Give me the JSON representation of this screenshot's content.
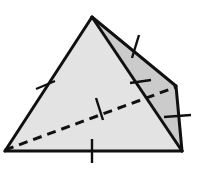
{
  "figure": {
    "name": "tetrahedron-diagram",
    "canvas": {
      "width": 203,
      "height": 175,
      "background": "#ffffff"
    },
    "colors": {
      "front_face_fill": "#e3e3e3",
      "right_face_fill": "#cbcbcb",
      "edge_stroke": "#101010",
      "hidden_edge_stroke": "#101010",
      "tick_stroke": "#101010"
    },
    "strokes": {
      "edge_width": 3.0,
      "hidden_edge_width": 3.0,
      "hidden_edge_dash": "9 6",
      "tick_width": 2.4
    },
    "vertices": [
      {
        "id": "apex",
        "label": "apex",
        "x": 92,
        "y": 17
      },
      {
        "id": "bottom-left",
        "label": "bottom left vertex",
        "x": 5,
        "y": 151
      },
      {
        "id": "bottom-right",
        "label": "bottom right vertex",
        "x": 182,
        "y": 151
      },
      {
        "id": "right-back",
        "label": "right back vertex",
        "x": 176,
        "y": 86
      }
    ],
    "faces": [
      {
        "id": "front-face",
        "label": "front triangular face",
        "points": "92,17 5,151 182,151",
        "fill": "#e3e3e3"
      },
      {
        "id": "right-face",
        "label": "right triangular face",
        "points": "92,17 176,86 182,151",
        "fill": "#cbcbcb"
      }
    ],
    "edges": [
      {
        "id": "edge-apex-bottom-left",
        "label": "apex to bottom left",
        "x1": 92,
        "y1": 17,
        "x2": 5,
        "y2": 151,
        "style": "solid"
      },
      {
        "id": "edge-bottom",
        "label": "bottom edge",
        "x1": 5,
        "y1": 151,
        "x2": 182,
        "y2": 151,
        "style": "solid"
      },
      {
        "id": "edge-apex-bottom-right",
        "label": "apex to bottom right",
        "x1": 92,
        "y1": 17,
        "x2": 182,
        "y2": 151,
        "style": "solid"
      },
      {
        "id": "edge-apex-right-back",
        "label": "apex to right back",
        "x1": 92,
        "y1": 17,
        "x2": 176,
        "y2": 86,
        "style": "solid"
      },
      {
        "id": "edge-right-back-bottom",
        "label": "right back to bottom right",
        "x1": 176,
        "y1": 86,
        "x2": 182,
        "y2": 151,
        "style": "solid"
      },
      {
        "id": "edge-hidden-diagonal",
        "label": "hidden edge bottom left to right back",
        "x1": 5,
        "y1": 150,
        "x2": 176,
        "y2": 87,
        "style": "dashed"
      }
    ],
    "tick_marks": [
      {
        "id": "tick-left-edge",
        "label": "tick on apex to bottom left edge",
        "x1": 36,
        "y1": 89,
        "x2": 55,
        "y2": 81
      },
      {
        "id": "tick-bottom-edge",
        "label": "tick on bottom edge",
        "x1": 92,
        "y1": 139,
        "x2": 92,
        "y2": 163
      },
      {
        "id": "tick-hidden-edge",
        "label": "tick on hidden diagonal edge",
        "x1": 96,
        "y1": 98,
        "x2": 103,
        "y2": 120
      },
      {
        "id": "tick-front-right-edge",
        "label": "tick on apex to bottom right edge",
        "x1": 130,
        "y1": 83,
        "x2": 151,
        "y2": 80
      },
      {
        "id": "tick-top-right-edge",
        "label": "tick on apex to right back edge",
        "x1": 139,
        "y1": 35,
        "x2": 132,
        "y2": 58
      },
      {
        "id": "tick-right-edge",
        "label": "tick on right back to bottom right edge",
        "x1": 164,
        "y1": 117,
        "x2": 191,
        "y2": 115
      }
    ]
  }
}
